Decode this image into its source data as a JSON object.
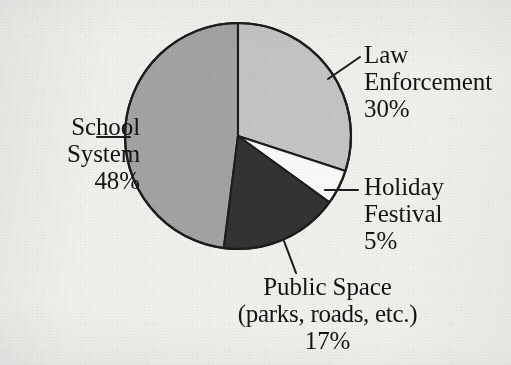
{
  "chart_data": {
    "type": "pie",
    "title": "",
    "subtitle": "",
    "xlabel": "",
    "ylabel": "",
    "legend_position": "callout-labels",
    "grid": false,
    "units": "percent",
    "start_angle_deg": 0,
    "direction": "clockwise",
    "categories": [
      "Law Enforcement",
      "Holiday Festival",
      "Public Space (parks, roads, etc.)",
      "School System"
    ],
    "values": [
      30,
      5,
      17,
      48
    ],
    "slices": [
      {
        "name": "Law Enforcement",
        "label_lines": [
          "Law",
          "Enforcement",
          "30%"
        ],
        "value": 30,
        "value_text": "30%",
        "color": "#c4c4c4",
        "start_deg": 0,
        "end_deg": 108
      },
      {
        "name": "Holiday Festival",
        "label_lines": [
          "Holiday",
          "Festival",
          "5%"
        ],
        "value": 5,
        "value_text": "5%",
        "color": "#fbfaf8",
        "start_deg": 108,
        "end_deg": 126
      },
      {
        "name": "Public Space",
        "label_lines": [
          "Public Space",
          "(parks, roads, etc.)",
          "17%"
        ],
        "value": 17,
        "value_text": "17%",
        "color": "#333333",
        "start_deg": 126,
        "end_deg": 187.2
      },
      {
        "name": "School System",
        "label_lines": [
          "School",
          "System",
          "48%"
        ],
        "value": 48,
        "value_text": "48%",
        "color": "#a3a3a3",
        "start_deg": 187.2,
        "end_deg": 360
      }
    ]
  },
  "colors": {
    "background": "#f1f0ed",
    "outline": "#1d1d1d",
    "text": "#141414",
    "law_enforcement": "#c4c4c4",
    "holiday_festival": "#fbfaf8",
    "public_space": "#333333",
    "school_system": "#a3a3a3"
  },
  "labels": {
    "law_enforcement": {
      "line1": "Law",
      "line2": "Enforcement",
      "line3": "30%"
    },
    "school_system": {
      "line1": "School",
      "line2": "System",
      "line3": "48%"
    },
    "holiday_festival": {
      "line1": "Holiday",
      "line2": "Festival",
      "line3": "5%"
    },
    "public_space": {
      "line1": "Public Space",
      "line2": "(parks, roads, etc.)",
      "line3": "17%"
    }
  }
}
